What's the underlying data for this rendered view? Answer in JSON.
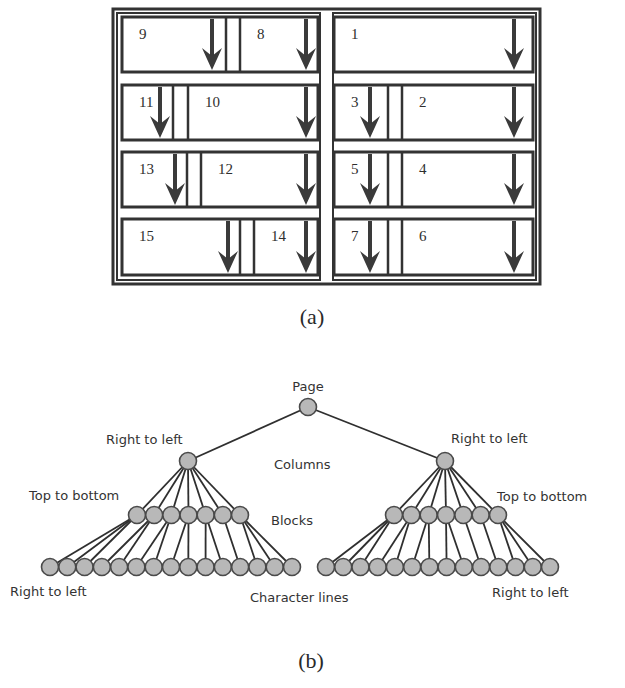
{
  "figure_a": {
    "caption": "(a)",
    "frame": {
      "x": 113,
      "y": 9,
      "w": 427,
      "h": 275
    },
    "colors": {
      "stroke": "#333333",
      "arrow": "#3a3a3a",
      "background": "#ffffff"
    },
    "columns": [
      {
        "name": "left-column",
        "x": 113,
        "w": 211,
        "rows": [
          {
            "blocks": [
              {
                "label": "9",
                "x1": 122,
                "x2": 226,
                "arrow_x": 212
              },
              {
                "label": "8",
                "x1": 240,
                "x2": 318,
                "arrow_x": 306
              }
            ],
            "gap": [
              226,
              240
            ]
          },
          {
            "blocks": [
              {
                "label": "11",
                "x1": 122,
                "x2": 173,
                "arrow_x": 160
              },
              {
                "label": "10",
                "x1": 188,
                "x2": 318,
                "arrow_x": 306
              }
            ],
            "gap": [
              173,
              188
            ]
          },
          {
            "blocks": [
              {
                "label": "13",
                "x1": 122,
                "x2": 187,
                "arrow_x": 175
              },
              {
                "label": "12",
                "x1": 201,
                "x2": 318,
                "arrow_x": 306
              }
            ],
            "gap": [
              187,
              201
            ]
          },
          {
            "blocks": [
              {
                "label": "15",
                "x1": 122,
                "x2": 240,
                "arrow_x": 228
              },
              {
                "label": "14",
                "x1": 254,
                "x2": 318,
                "arrow_x": 306
              }
            ],
            "gap": [
              240,
              254
            ]
          }
        ]
      },
      {
        "name": "right-column",
        "x": 329,
        "w": 211,
        "rows": [
          {
            "blocks": [
              {
                "label": "1",
                "x1": 334,
                "x2": 533,
                "arrow_x": 514
              }
            ],
            "gap": null
          },
          {
            "blocks": [
              {
                "label": "3",
                "x1": 334,
                "x2": 388,
                "arrow_x": 370
              },
              {
                "label": "2",
                "x1": 402,
                "x2": 533,
                "arrow_x": 514
              }
            ],
            "gap": [
              388,
              402
            ]
          },
          {
            "blocks": [
              {
                "label": "5",
                "x1": 334,
                "x2": 388,
                "arrow_x": 370
              },
              {
                "label": "4",
                "x1": 402,
                "x2": 533,
                "arrow_x": 514
              }
            ],
            "gap": [
              388,
              402
            ]
          },
          {
            "blocks": [
              {
                "label": "7",
                "x1": 334,
                "x2": 388,
                "arrow_x": 370
              },
              {
                "label": "6",
                "x1": 402,
                "x2": 533,
                "arrow_x": 514
              }
            ],
            "gap": [
              388,
              402
            ]
          }
        ]
      }
    ],
    "row_y": [
      [
        17,
        72
      ],
      [
        85,
        140
      ],
      [
        152,
        207
      ],
      [
        219,
        275
      ]
    ]
  },
  "figure_b": {
    "caption": "(b)",
    "colors": {
      "node_fill": "#b8b8b8",
      "node_stroke": "#4a4a4a",
      "edge": "#2f2f2f",
      "text": "#333333"
    },
    "node_radius": 8.5,
    "root": {
      "label": "Page",
      "x": 308,
      "y": 407
    },
    "level_labels": [
      {
        "text": "Columns",
        "x": 274,
        "y": 469
      },
      {
        "text": "Blocks",
        "x": 271,
        "y": 525
      },
      {
        "text": "Character lines",
        "x": 250,
        "y": 602
      }
    ],
    "direction_labels": [
      {
        "text": "Right to left",
        "x": 106,
        "y": 444
      },
      {
        "text": "Right to left",
        "x": 451,
        "y": 443
      },
      {
        "text": "Top to bottom",
        "x": 29,
        "y": 500
      },
      {
        "text": "Top to bottom",
        "x": 497,
        "y": 501
      },
      {
        "text": "Right to left",
        "x": 10,
        "y": 596
      },
      {
        "text": "Right to left",
        "x": 492,
        "y": 597
      }
    ],
    "subtrees": [
      {
        "name": "left",
        "column": {
          "x": 188,
          "y": 461
        },
        "blocks": {
          "y": 515,
          "x_start": 137,
          "x_end": 240,
          "count": 7
        },
        "lines": {
          "y": 567,
          "x_start": 50,
          "x_end": 292,
          "count": 15
        },
        "block_children": [
          [
            0,
            1,
            2
          ],
          [
            3,
            4
          ],
          [
            5,
            6
          ],
          [
            7,
            8
          ],
          [
            9,
            10
          ],
          [
            11
          ],
          [
            12,
            13,
            14
          ]
        ]
      },
      {
        "name": "right",
        "column": {
          "x": 445,
          "y": 461
        },
        "blocks": {
          "y": 515,
          "x_start": 394,
          "x_end": 498,
          "count": 7
        },
        "lines": {
          "y": 567,
          "x_start": 326,
          "x_end": 550,
          "count": 14
        },
        "block_children": [
          [
            0,
            1,
            2
          ],
          [
            3,
            4
          ],
          [
            5,
            6
          ],
          [
            7,
            8
          ],
          [
            9
          ],
          [
            10
          ],
          [
            11,
            12,
            13
          ]
        ]
      }
    ]
  }
}
